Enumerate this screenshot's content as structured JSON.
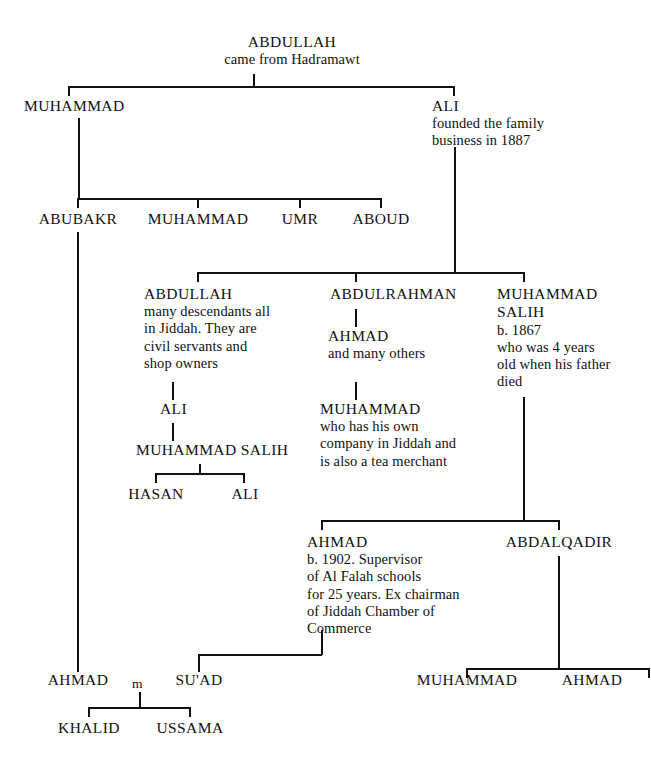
{
  "style": {
    "line_color": "#111111",
    "text_color": "#111111",
    "background": "#ffffff"
  },
  "marriage_symbol": "m",
  "nodes": {
    "abdullah_root": {
      "name": "ABDULLAH",
      "desc": "came from Hadramawt"
    },
    "muhammad_g2": {
      "name": "MUHAMMAD",
      "desc": ""
    },
    "ali_g2": {
      "name": "ALI",
      "desc": "founded the family\nbusiness in 1887"
    },
    "abubakr": {
      "name": "ABUBAKR",
      "desc": ""
    },
    "muhammad_g3": {
      "name": "MUHAMMAD",
      "desc": ""
    },
    "umr": {
      "name": "UMR",
      "desc": ""
    },
    "aboud": {
      "name": "ABOUD",
      "desc": ""
    },
    "abdullah_g4": {
      "name": "ABDULLAH",
      "desc": "many descendants all\nin Jiddah.  They are\ncivil servants and\nshop owners"
    },
    "abdulrahman": {
      "name": "ABDULRAHMAN",
      "desc": ""
    },
    "muhammad_salih_1867": {
      "name": "MUHAMMAD\nSALIH",
      "desc": "b. 1867\nwho was 4 years\nold when his father\ndied"
    },
    "ahmad_many_others": {
      "name": "AHMAD",
      "desc": "and many others"
    },
    "ali_g5": {
      "name": "ALI",
      "desc": ""
    },
    "muhammad_salih_g6": {
      "name": "MUHAMMAD SALIH",
      "desc": ""
    },
    "muhammad_tea": {
      "name": "MUHAMMAD",
      "desc": "who has his own\ncompany in Jiddah and\nis also a tea merchant"
    },
    "hasan": {
      "name": "HASAN",
      "desc": ""
    },
    "ali_g7": {
      "name": "ALI",
      "desc": ""
    },
    "ahmad_1902": {
      "name": "AHMAD",
      "desc": "b. 1902. Supervisor\nof Al Falah schools\nfor 25 years. Ex chairman\nof Jiddah Chamber of\nCommerce"
    },
    "abdalqadir": {
      "name": "ABDALQADIR",
      "desc": ""
    },
    "muhammad_bottom": {
      "name": "MUHAMMAD",
      "desc": ""
    },
    "ahmad_bottom_right": {
      "name": "AHMAD",
      "desc": ""
    },
    "ahmad_bottom_left": {
      "name": "AHMAD",
      "desc": ""
    },
    "suad": {
      "name": "SU'AD",
      "desc": ""
    },
    "khalid": {
      "name": "KHALID",
      "desc": ""
    },
    "ussama": {
      "name": "USSAMA",
      "desc": ""
    }
  }
}
